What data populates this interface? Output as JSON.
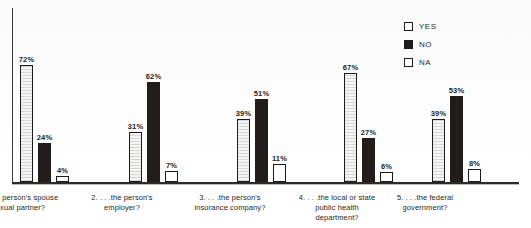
{
  "top_caption": "",
  "legend": {
    "position": "top-right",
    "entries": [
      {
        "label": "YES",
        "swatch": "yes",
        "swatch_icon": "legend-swatch-outline-icon",
        "color": "#f4f4f2"
      },
      {
        "label": "NO",
        "swatch": "no",
        "swatch_icon": "legend-swatch-filled-icon",
        "color": "#221d1b"
      },
      {
        "label": "NA",
        "swatch": "na",
        "swatch_icon": "legend-swatch-outline-icon",
        "color": "#ffffff"
      }
    ]
  },
  "chart_data": {
    "type": "bar",
    "title": "",
    "xlabel": "",
    "ylabel": "",
    "ylim": [
      0,
      100
    ],
    "grid": false,
    "legend_position": "top-right",
    "categories": [
      "1. . . .the person's spouse or sexual partner?",
      "2. . . .the person's employer?",
      "3. . . .the person's insurance company?",
      "4. . . .the local or state public health department?",
      "5. . . .the federal government?"
    ],
    "series": [
      {
        "name": "YES",
        "values": [
          72,
          31,
          39,
          67,
          39
        ],
        "color": "#f4f4f2"
      },
      {
        "name": "NO",
        "values": [
          24,
          62,
          51,
          27,
          53
        ],
        "color": "#221d1b"
      },
      {
        "name": "NA",
        "values": [
          4,
          7,
          11,
          6,
          8
        ],
        "color": "#ffffff"
      }
    ],
    "value_labels": [
      [
        "72%",
        "24%",
        "4%"
      ],
      [
        "31%",
        "62%",
        "7%"
      ],
      [
        "39%",
        "51%",
        "11%"
      ],
      [
        "67%",
        "27%",
        "6%"
      ],
      [
        "39%",
        "53%",
        "8%"
      ]
    ]
  },
  "groups": [
    {
      "index": "1",
      "left": 8,
      "label_left": -40,
      "label_lines": [
        "1. . . .the person's spouse",
        "or sexual partner?"
      ],
      "bars": [
        {
          "series": "YES",
          "value": 72,
          "label": "72%",
          "style": "yes"
        },
        {
          "series": "NO",
          "value": 24,
          "label": "24%",
          "style": "no"
        },
        {
          "series": "NA",
          "value": 4,
          "label": "4%",
          "style": "na"
        }
      ]
    },
    {
      "index": "2",
      "left": 117,
      "label_left": 68,
      "label_lines": [
        "2. . . .the person's",
        "employer?"
      ],
      "bars": [
        {
          "series": "YES",
          "value": 31,
          "label": "31%",
          "style": "yes"
        },
        {
          "series": "NO",
          "value": 62,
          "label": "62%",
          "style": "no"
        },
        {
          "series": "NA",
          "value": 7,
          "label": "7%",
          "style": "na"
        }
      ]
    },
    {
      "index": "3",
      "left": 225,
      "label_left": 176,
      "label_lines": [
        "3. . . .the person's",
        "insurance company?"
      ],
      "bars": [
        {
          "series": "YES",
          "value": 39,
          "label": "39%",
          "style": "yes"
        },
        {
          "series": "NO",
          "value": 51,
          "label": "51%",
          "style": "no"
        },
        {
          "series": "NA",
          "value": 11,
          "label": "11%",
          "style": "na"
        }
      ]
    },
    {
      "index": "4",
      "left": 332,
      "label_left": 283,
      "label_lines": [
        "4. . . .the local or state",
        "public health",
        "department?"
      ],
      "bars": [
        {
          "series": "YES",
          "value": 67,
          "label": "67%",
          "style": "yes"
        },
        {
          "series": "NO",
          "value": 27,
          "label": "27%",
          "style": "no"
        },
        {
          "series": "NA",
          "value": 6,
          "label": "6%",
          "style": "na"
        }
      ]
    },
    {
      "index": "5",
      "left": 420,
      "label_left": 371,
      "label_lines": [
        "5. . . .the federal",
        "government?"
      ],
      "bars": [
        {
          "series": "YES",
          "value": 39,
          "label": "39%",
          "style": "yes"
        },
        {
          "series": "NO",
          "value": 53,
          "label": "53%",
          "style": "no"
        },
        {
          "series": "NA",
          "value": 8,
          "label": "8%",
          "style": "na"
        }
      ]
    }
  ]
}
